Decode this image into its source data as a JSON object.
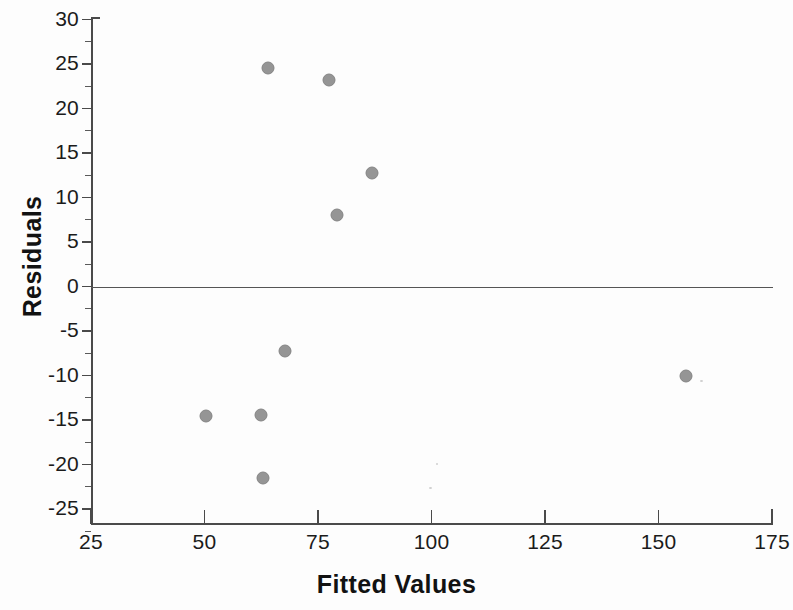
{
  "chart_data": {
    "type": "scatter",
    "title": "",
    "xlabel": "Fitted Values",
    "ylabel": "Residuals",
    "xlim": [
      25,
      175
    ],
    "ylim": [
      -27.5,
      30
    ],
    "xticks": [
      25,
      50,
      75,
      100,
      125,
      150,
      175
    ],
    "xtick_labels": [
      "25",
      "50",
      "75",
      "100",
      "125",
      "150",
      "175"
    ],
    "yticks": [
      30,
      25,
      20,
      15,
      10,
      5,
      0,
      -5,
      -10,
      -15,
      -20,
      -25
    ],
    "ytick_labels": [
      "30",
      "25",
      "20",
      "15",
      "10",
      "5",
      "0",
      "-5",
      "-10",
      "-15",
      "-20",
      "-25"
    ],
    "y_minor_ticks": [
      27.5,
      22.5,
      17.5,
      12.5,
      7.5,
      2.5,
      -2.5,
      -7.5,
      -12.5,
      -17.5,
      -22.5,
      -27.5
    ],
    "grid": false,
    "legend": null,
    "reference_line": {
      "y": 0,
      "color": "#555555"
    },
    "marker": {
      "shape": "circle",
      "color": "#8d8d8d",
      "edge_color": "#7a7a7a",
      "size": 13
    },
    "points": [
      {
        "x": 64.0,
        "y": 24.6
      },
      {
        "x": 77.4,
        "y": 23.2
      },
      {
        "x": 86.9,
        "y": 12.7
      },
      {
        "x": 79.2,
        "y": 8.0
      },
      {
        "x": 67.7,
        "y": -7.3
      },
      {
        "x": 50.3,
        "y": -14.5
      },
      {
        "x": 62.5,
        "y": -14.4
      },
      {
        "x": 62.9,
        "y": -21.5
      },
      {
        "x": 156.0,
        "y": -10.0
      }
    ]
  }
}
